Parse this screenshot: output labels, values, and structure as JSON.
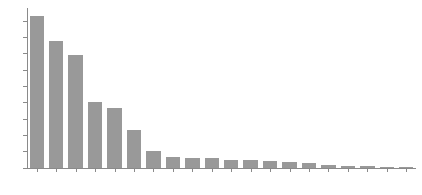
{
  "chart_data": {
    "type": "bar",
    "title": "",
    "subtitle": "",
    "xlabel": "",
    "ylabel": "",
    "orientation": "vertical",
    "grid": false,
    "legend": null,
    "legend_position": "none",
    "bar_color": "#999999",
    "axis_color": "#8a8a8a",
    "background_color": "#ffffff",
    "ylim": [
      0,
      9800
    ],
    "ytick_values": [
      0,
      1000,
      2000,
      3000,
      4000,
      5000,
      6000,
      7000,
      8000,
      9000
    ],
    "ytick_labels": [
      "0",
      "1000",
      "2000",
      "3000",
      "4000",
      "5000",
      "6000",
      "7000",
      "8000",
      "9000"
    ],
    "categories": [
      "cat-01",
      "cat-02",
      "cat-03",
      "cat-04",
      "cat-05",
      "cat-06",
      "cat-07",
      "cat-08",
      "cat-09",
      "cat-10",
      "cat-11",
      "cat-12",
      "cat-13",
      "cat-14",
      "cat-15",
      "cat-16",
      "cat-17",
      "cat-18",
      "cat-19",
      "cat-20"
    ],
    "xtick_labels": [
      "",
      "",
      "",
      "",
      "",
      "",
      "",
      "",
      "",
      "",
      "",
      "",
      "",
      "",
      "",
      "",
      "",
      "",
      "",
      ""
    ],
    "xtick_rotation": -48,
    "values": [
      9320,
      7750,
      6950,
      4060,
      3700,
      2350,
      1050,
      680,
      610,
      590,
      520,
      470,
      430,
      370,
      330,
      190,
      120,
      95,
      80,
      62
    ]
  }
}
